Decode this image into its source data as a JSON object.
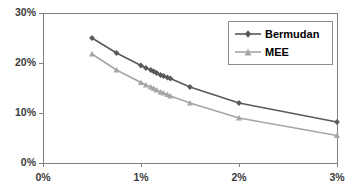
{
  "chart_data": {
    "type": "line",
    "title": "",
    "xlabel": "",
    "ylabel": "",
    "xlim": [
      0,
      3
    ],
    "ylim": [
      0,
      30
    ],
    "grid": false,
    "x_tick_labels": [
      "0%",
      "1%",
      "2%",
      "3%"
    ],
    "x_tick_values": [
      0,
      1,
      2,
      3
    ],
    "y_tick_labels": [
      "0%",
      "10%",
      "20%",
      "30%"
    ],
    "y_tick_values": [
      0,
      10,
      20,
      30
    ],
    "legend_position": "top-right",
    "series": [
      {
        "name": "Bermudan",
        "color": "#595959",
        "marker": "diamond",
        "x": [
          0.5,
          0.75,
          1.0,
          1.05,
          1.1,
          1.13,
          1.16,
          1.2,
          1.23,
          1.27,
          1.3,
          1.5,
          2.0,
          3.0
        ],
        "values": [
          25.0,
          22.0,
          19.5,
          19.0,
          18.6,
          18.3,
          18.0,
          17.6,
          17.4,
          17.1,
          16.9,
          15.2,
          12.0,
          8.2
        ]
      },
      {
        "name": "MEE",
        "color": "#a6a6a6",
        "marker": "triangle",
        "x": [
          0.5,
          0.75,
          1.0,
          1.05,
          1.1,
          1.13,
          1.16,
          1.2,
          1.23,
          1.27,
          1.3,
          1.5,
          2.0,
          3.0
        ],
        "values": [
          21.8,
          18.6,
          16.1,
          15.6,
          15.2,
          14.9,
          14.6,
          14.2,
          14.0,
          13.7,
          13.4,
          12.0,
          9.0,
          5.5
        ]
      }
    ]
  },
  "legend": {
    "entries": [
      {
        "label": "Bermudan",
        "color": "#595959"
      },
      {
        "label": "MEE",
        "color": "#a6a6a6"
      }
    ]
  },
  "axes": {
    "border_color": "#808080",
    "tick_color": "#808080",
    "label_color": "#3b3b3b"
  }
}
